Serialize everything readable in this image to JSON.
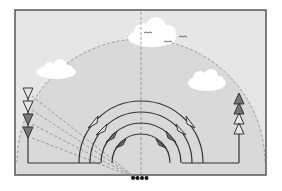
{
  "diagram": {
    "colors": {
      "background": "#ffffff",
      "frame_fill": "#e6e6e6",
      "dome_fill": "#d9d9d9",
      "frame_stroke": "#555555",
      "line": "#333333",
      "dash": "#888888",
      "cloud": "#ffffff",
      "arrow_dark": "#777777",
      "arrow_light": "#e6e6e6",
      "dots": "#111111"
    },
    "frame": {
      "x": 15,
      "y": 10,
      "w": 251,
      "h": 165
    },
    "dome": {
      "cx": 141,
      "cy": 163,
      "r": 124
    },
    "clouds": [
      {
        "name": "cloud-left",
        "cx": 56,
        "cy": 70
      },
      {
        "name": "cloud-top",
        "cx": 152,
        "cy": 33
      },
      {
        "name": "cloud-right",
        "cx": 207,
        "cy": 81
      }
    ],
    "birds": [
      {
        "x": 148,
        "y": 33
      },
      {
        "x": 168,
        "y": 42
      },
      {
        "x": 183,
        "y": 37
      }
    ],
    "left_arrows_count": 4,
    "right_arrows_count": 4,
    "arcs_count": 4,
    "dots_count": 4
  }
}
